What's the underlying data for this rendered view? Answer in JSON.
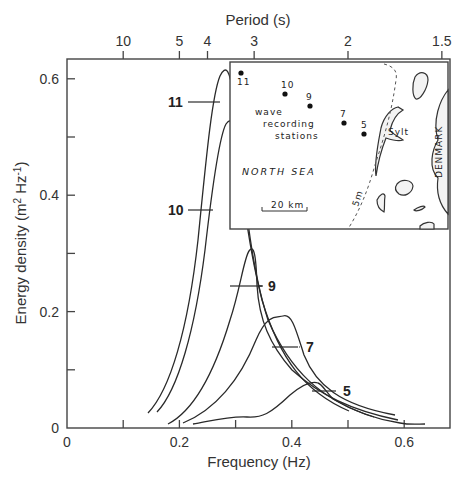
{
  "chart_data": {
    "type": "line",
    "title": "",
    "xlabel": "Frequency (Hz)",
    "ylabel": "Energy density (m² Hz⁻¹)",
    "ylabel_parts": {
      "text": "Energy density (m",
      "sup1": "2",
      "mid": " Hz",
      "sup2": "-1",
      "end": ")"
    },
    "top_axis_label": "Period (s)",
    "xlim": [
      0,
      0.7
    ],
    "ylim": [
      0,
      0.65
    ],
    "grid": false,
    "x_ticks": [
      0,
      0.1,
      0.2,
      0.3,
      0.4,
      0.5,
      0.6
    ],
    "x_tick_labels": [
      "0",
      "",
      "0.2",
      "",
      "0.4",
      "",
      "0.6"
    ],
    "y_ticks": [
      0,
      0.1,
      0.2,
      0.3,
      0.4,
      0.5,
      0.6
    ],
    "y_tick_labels": [
      "0",
      "",
      "0.2",
      "",
      "0.4",
      "",
      "0.6"
    ],
    "top_ticks": [
      {
        "label": "10",
        "freq": 0.1
      },
      {
        "label": "5",
        "freq": 0.2
      },
      {
        "label": "4",
        "freq": 0.25
      },
      {
        "label": "3",
        "freq": 0.333
      },
      {
        "label": "2",
        "freq": 0.5
      },
      {
        "label": "1.5",
        "freq": 0.667
      }
    ],
    "series": [
      {
        "name": "11",
        "peak_freq": 0.235,
        "peak_value": 0.61,
        "x": [
          0.15,
          0.18,
          0.2,
          0.215,
          0.225,
          0.235,
          0.245,
          0.26,
          0.28,
          0.32,
          0.38,
          0.45
        ],
        "y": [
          0.02,
          0.1,
          0.25,
          0.42,
          0.56,
          0.61,
          0.55,
          0.36,
          0.22,
          0.11,
          0.05,
          0.02
        ]
      },
      {
        "name": "10",
        "peak_freq": 0.245,
        "peak_value": 0.52,
        "x": [
          0.16,
          0.19,
          0.21,
          0.225,
          0.235,
          0.245,
          0.255,
          0.27,
          0.29,
          0.33,
          0.4,
          0.48
        ],
        "y": [
          0.02,
          0.1,
          0.24,
          0.38,
          0.48,
          0.52,
          0.47,
          0.32,
          0.2,
          0.1,
          0.05,
          0.02
        ]
      },
      {
        "name": "9",
        "peak_freq": 0.29,
        "peak_value": 0.3,
        "x": [
          0.19,
          0.22,
          0.25,
          0.27,
          0.28,
          0.29,
          0.3,
          0.31,
          0.33,
          0.37,
          0.44,
          0.53
        ],
        "y": [
          0.01,
          0.05,
          0.14,
          0.24,
          0.29,
          0.3,
          0.27,
          0.18,
          0.12,
          0.07,
          0.03,
          0.01
        ]
      },
      {
        "name": "7",
        "peak_freq": 0.34,
        "peak_value": 0.19,
        "x": [
          0.21,
          0.25,
          0.28,
          0.31,
          0.33,
          0.34,
          0.355,
          0.37,
          0.39,
          0.42,
          0.47
        ],
        "y": [
          0.01,
          0.04,
          0.09,
          0.15,
          0.185,
          0.19,
          0.17,
          0.12,
          0.07,
          0.03,
          0.01
        ]
      },
      {
        "name": "5",
        "peak_freq": 0.42,
        "peak_value": 0.075,
        "x": [
          0.23,
          0.26,
          0.29,
          0.32,
          0.35,
          0.38,
          0.41,
          0.43,
          0.45,
          0.48,
          0.53,
          0.59,
          0.64
        ],
        "y": [
          0.01,
          0.02,
          0.025,
          0.025,
          0.04,
          0.065,
          0.075,
          0.072,
          0.05,
          0.03,
          0.015,
          0.005,
          0.003
        ]
      }
    ]
  },
  "labels": {
    "top_axis_title": "Period (s)",
    "x_axis_title": "Frequency (Hz)",
    "y_axis_title": {
      "text": "Energy density (m",
      "sup1": "2",
      "mid": " Hz",
      "sup2": "-1",
      "end": ")"
    },
    "series_labels": [
      "11",
      "10",
      "9",
      "7",
      "5"
    ]
  },
  "inset_map": {
    "stations": [
      {
        "id": "11"
      },
      {
        "id": "10"
      },
      {
        "id": "9"
      },
      {
        "id": "7"
      },
      {
        "id": "5"
      }
    ],
    "legend_line1": "wave",
    "legend_line2": "recording",
    "legend_line3": "stations",
    "sea_label": "NORTH SEA",
    "island_label": "Sylt",
    "country_label": "DENMARK",
    "depth_label": "5m",
    "scale_label": "20 km"
  }
}
